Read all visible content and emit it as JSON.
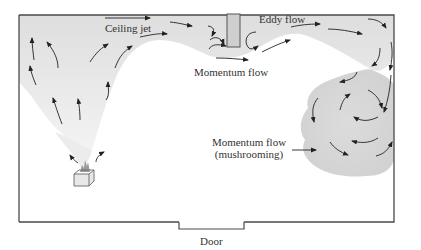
{
  "diagram": {
    "labels": {
      "ceiling_jet": "Ceiling jet",
      "eddy_flow": "Eddy flow",
      "momentum_flow": "Momentum flow",
      "momentum_flow_mushroom_line1": "Momentum flow",
      "momentum_flow_mushroom_line2": "(mushrooming)",
      "door": "Door"
    },
    "components": [
      {
        "id": "room",
        "type": "enclosure"
      },
      {
        "id": "fire-source",
        "type": "box with flame"
      },
      {
        "id": "smoke-plume",
        "type": "rising plume"
      },
      {
        "id": "ceiling-jet",
        "type": "horizontal flow along ceiling"
      },
      {
        "id": "soffit",
        "type": "downstand column from ceiling"
      },
      {
        "id": "eddy",
        "type": "circular recirculation"
      },
      {
        "id": "mushroom-cloud",
        "type": "spiralling smoke mass"
      },
      {
        "id": "door",
        "type": "floor opening"
      }
    ],
    "colors": {
      "outline": "#4a4a4a",
      "smoke_light": "#eeeeee",
      "smoke_dark": "#d8d8d8",
      "arrow": "#222222",
      "text": "#333333"
    }
  }
}
